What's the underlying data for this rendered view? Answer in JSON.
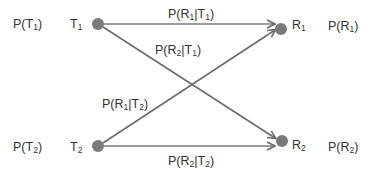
{
  "diagram": {
    "type": "binary channel transition diagram",
    "colors": {
      "node": "#777777",
      "line": "#6b6b6b",
      "text": "#333333",
      "background": "#ffffff"
    },
    "inputs": [
      {
        "id": "T1",
        "base": "T",
        "sub": "1",
        "prob_base": "P(T",
        "prob_sub": "1",
        "prob_tail": ")"
      },
      {
        "id": "T2",
        "base": "T",
        "sub": "2",
        "prob_base": "P(T",
        "prob_sub": "2",
        "prob_tail": ")"
      }
    ],
    "outputs": [
      {
        "id": "R1",
        "base": "R",
        "sub": "1",
        "prob_base": "P(R",
        "prob_sub": "1",
        "prob_tail": ")"
      },
      {
        "id": "R2",
        "base": "R",
        "sub": "2",
        "prob_base": "P(R",
        "prob_sub": "2",
        "prob_tail": ")"
      }
    ],
    "edges": [
      {
        "from": "T1",
        "to": "R1",
        "a": "P(R",
        "a_sub": "1",
        "b": "|T",
        "b_sub": "1",
        "c": ")"
      },
      {
        "from": "T1",
        "to": "R2",
        "a": "P(R",
        "a_sub": "2",
        "b": "|T",
        "b_sub": "1",
        "c": ")"
      },
      {
        "from": "T2",
        "to": "R1",
        "a": "P(R",
        "a_sub": "1",
        "b": "|T",
        "b_sub": "2",
        "c": ")"
      },
      {
        "from": "T2",
        "to": "R2",
        "a": "P(R",
        "a_sub": "2",
        "b": "|T",
        "b_sub": "2",
        "c": ")"
      }
    ]
  }
}
